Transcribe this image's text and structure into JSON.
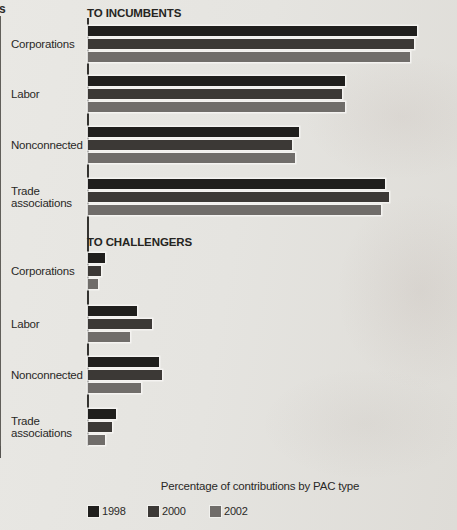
{
  "page": {
    "left_edge_fragment": "s",
    "background_color": "#e5e4e0"
  },
  "chart_data": {
    "type": "bar",
    "orientation": "horizontal",
    "title": "",
    "xlabel": "Percentage of contributions by PAC type",
    "ylabel": "",
    "xlim": [
      0,
      100
    ],
    "xticks": [
      0,
      20,
      40,
      60,
      80,
      100
    ],
    "grid": "vertical",
    "legend_position": "bottom",
    "legend": [
      "1998",
      "2000",
      "2002"
    ],
    "series_colors": {
      "1998": "#201f1d",
      "2000": "#3c3936",
      "2002": "#706d6a"
    },
    "categories": [
      "Corporations",
      "Labor",
      "Nonconnected",
      "Trade associations"
    ],
    "sections": [
      {
        "header": "TO INCUMBENTS",
        "series": [
          {
            "name": "1998",
            "values": [
              92,
              72,
              59,
              83
            ]
          },
          {
            "name": "2000",
            "values": [
              91,
              71,
              57,
              84
            ]
          },
          {
            "name": "2002",
            "values": [
              90,
              72,
              58,
              82
            ]
          }
        ]
      },
      {
        "header": "TO CHALLENGERS",
        "series": [
          {
            "name": "1998",
            "values": [
              5,
              14,
              20,
              8
            ]
          },
          {
            "name": "2000",
            "values": [
              4,
              18,
              21,
              7
            ]
          },
          {
            "name": "2002",
            "values": [
              3,
              12,
              15,
              5
            ]
          }
        ]
      }
    ]
  }
}
